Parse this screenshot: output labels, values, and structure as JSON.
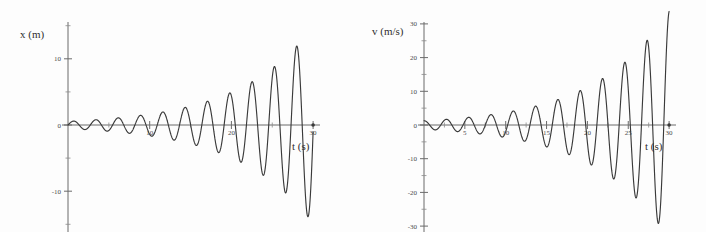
{
  "figure": {
    "background_color": "#fdfdfd",
    "curve_color": "#3a3a3a",
    "axis_color": "#6b6b6b"
  },
  "chart_data": [
    {
      "type": "line",
      "id": "position-vs-time",
      "title": "",
      "xlabel": "t (s)",
      "ylabel": "x (m)",
      "xlim": [
        0,
        30
      ],
      "ylim": [
        -20,
        16
      ],
      "grid": false,
      "legend": "none",
      "x_ticks_major": [
        10,
        20,
        30
      ],
      "x_tick_labels": [
        "10",
        "20",
        "30"
      ],
      "x_ticks_minor": [
        5,
        15,
        25
      ],
      "y_ticks_major": [
        10,
        0,
        -10
      ],
      "y_tick_labels": [
        "10",
        "0",
        "-10"
      ],
      "y_ticks_minor": [
        15,
        5,
        -5,
        -15
      ],
      "description": "Growing (anti-damped) sinusoidal oscillation of position",
      "model": {
        "form": "A0 * exp(t/tau) * sin(2*pi*t/T)",
        "A0": 0.55,
        "tau": 9.1,
        "period": 2.73,
        "phase": 0.0
      },
      "peaks": [
        {
          "t": 0.68,
          "x": 0.6
        },
        {
          "t": 3.41,
          "x": 0.85
        },
        {
          "t": 6.14,
          "x": 1.2
        },
        {
          "t": 8.87,
          "x": 1.7
        },
        {
          "t": 1.36,
          "x": -0.7
        },
        {
          "t": 4.09,
          "x": -1.0
        }
      ],
      "sampled_points": [
        {
          "t": 0,
          "x": 0
        },
        {
          "t": 1.0,
          "x": 0.75
        },
        {
          "t": 2.0,
          "x": -1.4
        },
        {
          "t": 4.0,
          "x": 2.2
        },
        {
          "t": 6.0,
          "x": -3.0
        },
        {
          "t": 8.0,
          "x": 3.9
        },
        {
          "t": 11.0,
          "x": 5.3
        },
        {
          "t": 13.0,
          "x": -6.0
        },
        {
          "t": 16.0,
          "x": 6.8
        },
        {
          "t": 19.0,
          "x": -7.5
        },
        {
          "t": 21.0,
          "x": 9.8
        },
        {
          "t": 24.0,
          "x": -11.0
        },
        {
          "t": 26.0,
          "x": 12.5
        },
        {
          "t": 28.0,
          "x": -14.5
        },
        {
          "t": 30.0,
          "x": 14.6
        }
      ]
    },
    {
      "type": "line",
      "id": "velocity-vs-time",
      "title": "",
      "xlabel": "t (s)",
      "ylabel": "v (m/s)",
      "xlim": [
        0,
        30
      ],
      "ylim": [
        -32,
        32
      ],
      "grid": false,
      "legend": "none",
      "x_ticks_major": [
        5,
        10,
        15,
        20,
        25,
        30
      ],
      "x_tick_labels": [
        "5",
        "10",
        "15",
        "20",
        "25",
        "30"
      ],
      "x_ticks_minor": [
        2.5,
        7.5,
        12.5,
        17.5,
        22.5,
        27.5
      ],
      "y_ticks_major": [
        30,
        20,
        10,
        0,
        -10,
        -20,
        -30
      ],
      "y_tick_labels": [
        "30",
        "20",
        "10",
        "0",
        "-10",
        "-20",
        "-30"
      ],
      "y_ticks_minor": [
        25,
        15,
        5,
        -5,
        -15,
        -25
      ],
      "description": "Growing (anti-damped) sinusoidal oscillation of velocity",
      "model": {
        "form": "V0 * exp(t/tau) * cos(2*pi*t/T)",
        "V0": 1.25,
        "tau": 9.1,
        "period": 2.73,
        "phase": 0.0
      },
      "sampled_points": [
        {
          "t": 0,
          "v": 1.3
        },
        {
          "t": 1.4,
          "v": -2.2
        },
        {
          "t": 2.7,
          "v": 2.9
        },
        {
          "t": 4.1,
          "v": -4.2
        },
        {
          "t": 5.5,
          "v": 6.8
        },
        {
          "t": 6.8,
          "v": -7.4
        },
        {
          "t": 8.2,
          "v": 9.9
        },
        {
          "t": 9.6,
          "v": -10.6
        },
        {
          "t": 11.0,
          "v": 13.0
        },
        {
          "t": 12.3,
          "v": -13.5
        },
        {
          "t": 13.7,
          "v": 16.0
        },
        {
          "t": 15.0,
          "v": -16.6
        },
        {
          "t": 16.4,
          "v": 19.2
        },
        {
          "t": 17.8,
          "v": -19.8
        },
        {
          "t": 19.1,
          "v": 22.3
        },
        {
          "t": 20.5,
          "v": -23.0
        },
        {
          "t": 21.9,
          "v": 25.5
        },
        {
          "t": 23.2,
          "v": -26.1
        },
        {
          "t": 24.6,
          "v": 28.4
        },
        {
          "t": 26.0,
          "v": -29.5
        },
        {
          "t": 30.0,
          "v": -30.0
        }
      ]
    }
  ]
}
